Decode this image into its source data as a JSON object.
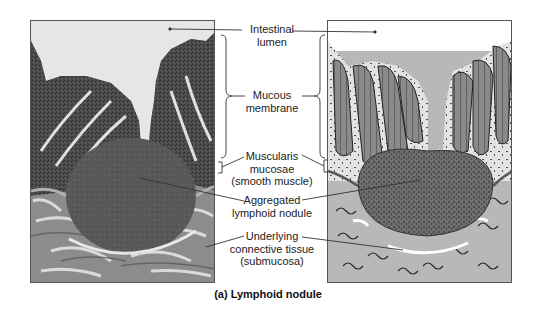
{
  "figure": {
    "caption": "(a) Lymphoid nodule",
    "panels": [
      {
        "id": "micrograph",
        "description": "Light micrograph of intestinal wall showing lymphoid nodule"
      },
      {
        "id": "illustration",
        "description": "Drawing of intestinal wall showing lymphoid nodule"
      }
    ],
    "labels": [
      {
        "id": "intestinal-lumen",
        "text": "Intestinal\nlumen"
      },
      {
        "id": "mucous-membrane",
        "text": "Mucous\nmembrane"
      },
      {
        "id": "muscularis-mucosae",
        "text": "Muscularis\nmucosae\n(smooth muscle)"
      },
      {
        "id": "aggregated-lymphoid-nodule",
        "text": "Aggregated\nlymphoid nodule"
      },
      {
        "id": "underlying-connective-tissue",
        "text": "Underlying\nconnective tissue\n(submucosa)"
      }
    ]
  }
}
